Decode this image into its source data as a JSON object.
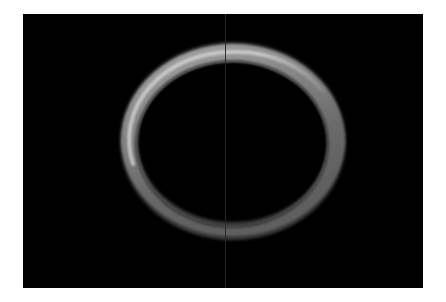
{
  "image": {
    "subject": "metallic ring on black background",
    "background_color": "#000000",
    "border_color": "#ffffff",
    "ring": {
      "base_color": "#6e6e6e",
      "highlight_color": "#bdbdbd",
      "shadow_color": "#3a3a3a"
    },
    "divider_line_color": "#2a2a2a"
  }
}
